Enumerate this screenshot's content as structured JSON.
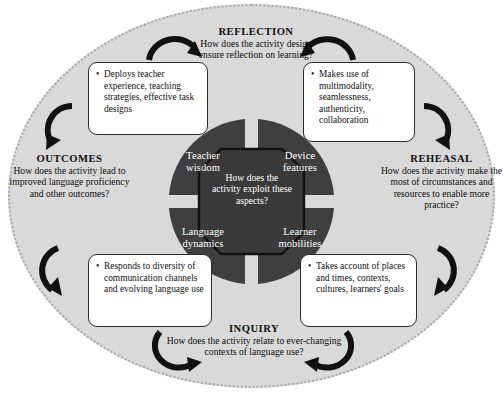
{
  "diagram": {
    "colors": {
      "ellipse_fill": "#d9d9d9",
      "wheel_fill": "#3f3f3f",
      "hub_fill": "#3a3a3a",
      "callout_fill": "#ffffff",
      "text_dark": "#111111",
      "text_light": "#ffffff"
    }
  },
  "hub": {
    "text": "How does the activity exploit these aspects?"
  },
  "quadrants": [
    {
      "id": "teacher-wisdom",
      "label": "Teacher wisdom"
    },
    {
      "id": "device-features",
      "label": "Device features"
    },
    {
      "id": "language-dynamics",
      "label": "Language dynamics"
    },
    {
      "id": "learner-mobilities",
      "label": "Learner mobilities"
    }
  ],
  "stages": [
    {
      "id": "reflection",
      "title": "REFLECTION",
      "question": "How does the activity design ensure reflection on learning?"
    },
    {
      "id": "rehearsal",
      "title": "REHEASAL",
      "question": "How does the activity make the most of circumstances and resources to enable more practice?"
    },
    {
      "id": "inquiry",
      "title": "INQUIRY",
      "question": "How does the activity relate to ever-changing contexts of language use?"
    },
    {
      "id": "outcomes",
      "title": "OUTCOMES",
      "question": "How does the activity lead to improved language proficiency and other outcomes?"
    }
  ],
  "callouts": [
    {
      "id": "teacher-wisdom-callout",
      "text": "Deploys teacher experience, teaching strategies, effective task designs"
    },
    {
      "id": "device-features-callout",
      "text": "Makes use of multimodality, seamlessness, authenticity, collaboration"
    },
    {
      "id": "language-dynamics-callout",
      "text": "Responds to diversity of communication channels and evolving language use"
    },
    {
      "id": "learner-mobilities-callout",
      "text": "Takes account of places and times, contexts, cultures, learners' goals"
    }
  ]
}
